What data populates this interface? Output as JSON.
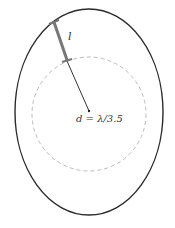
{
  "diagram": {
    "labels": {
      "segment": "l",
      "distance": "d = λ/3.5"
    },
    "colors": {
      "outer": "#2a2a2a",
      "dashed": "#bbbbbb",
      "segment": "#777777",
      "line": "#333333"
    }
  }
}
